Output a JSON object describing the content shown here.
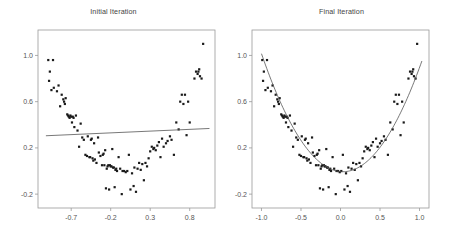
{
  "figure": {
    "background": "#ffffff",
    "point_color": "#1a1a1a",
    "line_color": "#555555",
    "frame_color": "#999999",
    "tick_color": "#555555"
  },
  "panels": [
    {
      "id": "initial-iteration",
      "title": "Initial Iteration",
      "fit_type": "line",
      "fit_label": "linear fit",
      "xticks": [
        "-0.7",
        "-0.2",
        "0.3",
        "0.8"
      ],
      "xtick_values": [
        -0.7,
        -0.2,
        0.3,
        0.8
      ],
      "yticks": [
        "1.0",
        "0.6",
        "0.2",
        "-0.2"
      ],
      "ytick_values": [
        1.0,
        0.6,
        0.2,
        -0.2
      ],
      "xlim": [
        -1.12,
        1.12
      ],
      "ylim": [
        -0.32,
        1.22
      ],
      "fit_endpoints": [
        [
          -1.02,
          0.305
        ],
        [
          1.05,
          0.368
        ]
      ]
    },
    {
      "id": "final-iteration",
      "title": "Final Iteration",
      "fit_type": "parabola",
      "fit_label": "quadratic fit",
      "xticks": [
        "-1.0",
        "-0.5",
        "0.0",
        "0.5",
        "1.0"
      ],
      "xtick_values": [
        -1.0,
        -0.5,
        0.0,
        0.5,
        1.0
      ],
      "yticks": [
        "1.0",
        "0.6",
        "0.2",
        "-0.2"
      ],
      "ytick_values": [
        1.0,
        0.6,
        0.2,
        -0.2
      ],
      "xlim": [
        -1.12,
        1.12
      ],
      "ylim": [
        -0.32,
        1.22
      ],
      "fit_coefficients": {
        "a": 0.96,
        "b": -0.06,
        "c": -0.005
      },
      "fit_domain": [
        -1.0,
        1.03
      ]
    }
  ],
  "chart_data": {
    "type": "scatter",
    "xlabel": "",
    "ylabel": "",
    "xlim": [
      -1.12,
      1.12
    ],
    "ylim": [
      -0.32,
      1.22
    ],
    "grid": false,
    "legend": "none",
    "note": "Both panels show the same scatter sample; left overlays a near-flat linear fit, right overlays the converged quadratic fit.",
    "points": [
      [
        -0.99,
        0.96
      ],
      [
        -0.98,
        0.78
      ],
      [
        -0.97,
        0.86
      ],
      [
        -0.95,
        0.7
      ],
      [
        -0.93,
        0.96
      ],
      [
        -0.92,
        0.72
      ],
      [
        -0.88,
        0.69
      ],
      [
        -0.86,
        0.74
      ],
      [
        -0.84,
        0.56
      ],
      [
        -0.82,
        0.66
      ],
      [
        -0.8,
        0.62
      ],
      [
        -0.79,
        0.6
      ],
      [
        -0.78,
        0.58
      ],
      [
        -0.77,
        0.63
      ],
      [
        -0.75,
        0.49
      ],
      [
        -0.74,
        0.48
      ],
      [
        -0.73,
        0.47
      ],
      [
        -0.72,
        0.46
      ],
      [
        -0.71,
        0.48
      ],
      [
        -0.7,
        0.47
      ],
      [
        -0.69,
        0.42
      ],
      [
        -0.68,
        0.47
      ],
      [
        -0.67,
        0.46
      ],
      [
        -0.66,
        0.38
      ],
      [
        -0.64,
        0.48
      ],
      [
        -0.62,
        0.35
      ],
      [
        -0.6,
        0.21
      ],
      [
        -0.58,
        0.41
      ],
      [
        -0.56,
        0.29
      ],
      [
        -0.54,
        0.27
      ],
      [
        -0.52,
        0.14
      ],
      [
        -0.5,
        0.13
      ],
      [
        -0.49,
        0.3
      ],
      [
        -0.47,
        0.12
      ],
      [
        -0.46,
        0.12
      ],
      [
        -0.45,
        0.27
      ],
      [
        -0.44,
        0.28
      ],
      [
        -0.43,
        0.11
      ],
      [
        -0.42,
        0.09
      ],
      [
        -0.41,
        0.24
      ],
      [
        -0.4,
        0.1
      ],
      [
        -0.38,
        0.07
      ],
      [
        -0.36,
        0.29
      ],
      [
        -0.35,
        0.16
      ],
      [
        -0.33,
        0.13
      ],
      [
        -0.31,
        0.05
      ],
      [
        -0.3,
        0.14
      ],
      [
        -0.29,
        0.15
      ],
      [
        -0.28,
        0.05
      ],
      [
        -0.27,
        0.18
      ],
      [
        -0.26,
        -0.15
      ],
      [
        -0.25,
        0.02
      ],
      [
        -0.24,
        0.04
      ],
      [
        -0.23,
        0.05
      ],
      [
        -0.22,
        -0.16
      ],
      [
        -0.21,
        0.05
      ],
      [
        -0.2,
        0.04
      ],
      [
        -0.19,
        0.04
      ],
      [
        -0.18,
        0.19
      ],
      [
        -0.17,
        0.03
      ],
      [
        -0.16,
        0.03
      ],
      [
        -0.15,
        -0.14
      ],
      [
        -0.14,
        0.01
      ],
      [
        -0.13,
        0.02
      ],
      [
        -0.12,
        0.0
      ],
      [
        -0.1,
        0.12
      ],
      [
        -0.08,
        0.02
      ],
      [
        -0.06,
        -0.2
      ],
      [
        -0.05,
        0.0
      ],
      [
        -0.03,
        0.0
      ],
      [
        -0.01,
        -0.01
      ],
      [
        0.01,
        0.0
      ],
      [
        0.03,
        0.14
      ],
      [
        0.05,
        -0.16
      ],
      [
        0.07,
        -0.02
      ],
      [
        0.09,
        -0.13
      ],
      [
        0.1,
        0.03
      ],
      [
        0.12,
        -0.18
      ],
      [
        0.14,
        0.02
      ],
      [
        0.16,
        0.07
      ],
      [
        0.18,
        0.01
      ],
      [
        0.2,
        0.06
      ],
      [
        0.22,
        -0.08
      ],
      [
        0.24,
        0.07
      ],
      [
        0.26,
        0.04
      ],
      [
        0.28,
        0.11
      ],
      [
        0.3,
        0.17
      ],
      [
        0.32,
        0.21
      ],
      [
        0.34,
        0.19
      ],
      [
        0.35,
        0.2
      ],
      [
        0.37,
        0.18
      ],
      [
        0.39,
        0.22
      ],
      [
        0.41,
        0.25
      ],
      [
        0.43,
        0.12
      ],
      [
        0.45,
        0.28
      ],
      [
        0.47,
        0.21
      ],
      [
        0.5,
        0.24
      ],
      [
        0.52,
        0.26
      ],
      [
        0.55,
        0.3
      ],
      [
        0.57,
        0.27
      ],
      [
        0.6,
        0.14
      ],
      [
        0.63,
        0.42
      ],
      [
        0.66,
        0.36
      ],
      [
        0.68,
        0.6
      ],
      [
        0.7,
        0.66
      ],
      [
        0.72,
        0.58
      ],
      [
        0.74,
        0.66
      ],
      [
        0.76,
        0.31
      ],
      [
        0.78,
        0.6
      ],
      [
        0.8,
        0.42
      ],
      [
        0.86,
        0.8
      ],
      [
        0.88,
        0.86
      ],
      [
        0.9,
        0.84
      ],
      [
        0.91,
        0.86
      ],
      [
        0.92,
        0.88
      ],
      [
        0.93,
        0.82
      ],
      [
        0.95,
        0.8
      ],
      [
        0.97,
        1.1
      ]
    ]
  }
}
